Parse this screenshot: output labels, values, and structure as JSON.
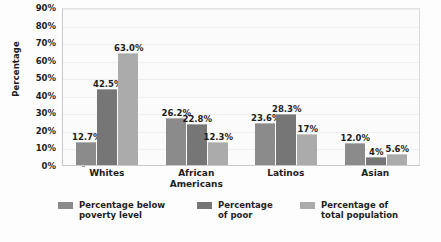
{
  "figure": {
    "title_sliver": "",
    "background_color": "#fdfdfd",
    "plot_background_color": "#fbfbfb"
  },
  "chart_data": {
    "type": "bar",
    "title": "",
    "xlabel": "",
    "ylabel": "Percentage",
    "ylim": [
      0,
      90
    ],
    "ytick_labels": [
      "0%",
      "10%",
      "20%",
      "30%",
      "40%",
      "50%",
      "60%",
      "70%",
      "80%",
      "90%"
    ],
    "ytick_values": [
      0,
      10,
      20,
      30,
      40,
      50,
      60,
      70,
      80,
      90
    ],
    "grid": false,
    "legend_position": "bottom",
    "categories": [
      "Whites",
      "African\nAmericans",
      "Latinos",
      "Asian"
    ],
    "series": [
      {
        "name": "Percentage below\npoverty level",
        "color": "#8b8b8b",
        "values": [
          12.7,
          26.2,
          23.6,
          12.0
        ],
        "labels": [
          "12.7%",
          "26.2%",
          "23.6%",
          "12.0%"
        ]
      },
      {
        "name": "Percentage\nof poor",
        "color": "#767676",
        "values": [
          42.5,
          22.8,
          28.3,
          4.0
        ],
        "labels": [
          "42.5%",
          "22.8%",
          "28.3%",
          "4%"
        ]
      },
      {
        "name": "Percentage of\ntotal population",
        "color": "#ababab",
        "values": [
          63.0,
          12.3,
          17.0,
          5.6
        ],
        "labels": [
          "63.0%",
          "12.3%",
          "17%",
          "5.6%"
        ]
      }
    ]
  }
}
